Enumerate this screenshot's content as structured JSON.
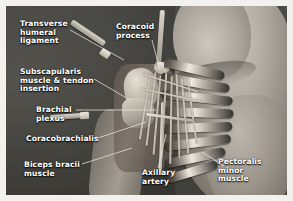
{
  "figure": {
    "type": "anatomical-dissection-photograph",
    "region": "shoulder and axilla",
    "view": "anterior dissection of the right axilla",
    "rendering": "grayscale photograph with white annotation labels and leader lines",
    "background_color": "#45443f",
    "label_color": "#ffffff",
    "leader_line_color": "#e8e5dd",
    "border_color": "#f2f1ee"
  },
  "labels": [
    {
      "id": "transverse-humeral-ligament",
      "text": "Transverse\nhumeral\nligament",
      "x": 14,
      "y": 14,
      "leader": [
        [
          64,
          24
        ],
        [
          118,
          54
        ]
      ]
    },
    {
      "id": "coracoid-process",
      "text": "Coracoid\nprocess",
      "x": 110,
      "y": 17,
      "leader": [
        [
          146,
          34
        ],
        [
          154,
          64
        ]
      ]
    },
    {
      "id": "subscapularis-muscle-tendon-insertion",
      "text": "Subscapularis\nmuscle & tendon\ninsertion",
      "x": 14,
      "y": 62,
      "leader": [
        [
          88,
          73
        ],
        [
          124,
          94
        ]
      ]
    },
    {
      "id": "brachial-plexus",
      "text": "Brachial\nplexus",
      "x": 30,
      "y": 100,
      "leader": [
        [
          70,
          104
        ],
        [
          150,
          104
        ]
      ]
    },
    {
      "id": "coracobrachialis",
      "text": "Coracobrachialis",
      "x": 20,
      "y": 129,
      "leader": [
        [
          92,
          132
        ],
        [
          140,
          116
        ]
      ]
    },
    {
      "id": "biceps-bracii-muscle",
      "text": "Biceps bracii\nmuscle",
      "x": 18,
      "y": 155,
      "leader": [
        [
          76,
          158
        ],
        [
          126,
          142
        ]
      ]
    },
    {
      "id": "axillary-artery",
      "text": "Axillary\nartery",
      "x": 136,
      "y": 163,
      "leader": [
        [
          152,
          162
        ],
        [
          160,
          128
        ]
      ]
    },
    {
      "id": "pectoralis-minor-muscle",
      "text": "Pectoralis\nminor\nmuscle",
      "x": 220,
      "y": 155,
      "leader": [
        [
          218,
          160
        ],
        [
          196,
          146
        ]
      ]
    }
  ],
  "structures": [
    {
      "id": "humeral-head",
      "name": "humeral head"
    },
    {
      "id": "coracoid-process-bone",
      "name": "coracoid process"
    },
    {
      "id": "subscapularis-tendon",
      "name": "subscapularis tendon insertion"
    },
    {
      "id": "brachial-plexus-cords",
      "name": "brachial plexus cords"
    },
    {
      "id": "axillary-artery-vessel",
      "name": "axillary artery"
    },
    {
      "id": "pectoralis-minor",
      "name": "pectoralis minor muscle"
    },
    {
      "id": "coracobrachialis-muscle",
      "name": "coracobrachialis muscle"
    },
    {
      "id": "biceps-brachii",
      "name": "biceps brachii muscle"
    },
    {
      "id": "retractor-instrument",
      "name": "surgical retractor"
    },
    {
      "id": "probe-instrument",
      "name": "dissecting probe"
    }
  ]
}
